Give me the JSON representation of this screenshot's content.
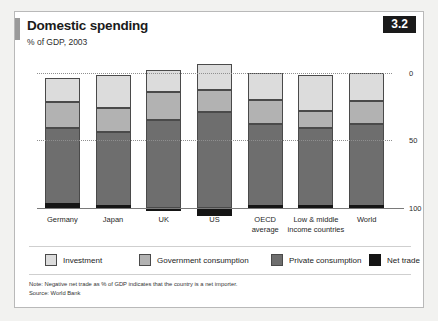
{
  "figure": {
    "badge": "3.2",
    "title": "Domestic spending",
    "subtitle": "% of GDP, 2003",
    "note": "Note: Negative net trade as % of GDP indicates that the country is a net importer.",
    "source": "Source: World Bank"
  },
  "legend": {
    "items": [
      {
        "label": "Investment",
        "key": "investment",
        "color": "#dcdcdc"
      },
      {
        "label": "Government consumption",
        "key": "government",
        "color": "#b2b2b2"
      },
      {
        "label": "Private consumption",
        "key": "private",
        "color": "#6e6e6e"
      },
      {
        "label": "Net trade",
        "key": "nettrade",
        "color": "#151515"
      }
    ]
  },
  "axis": {
    "yticks": [
      "100",
      "50",
      "0"
    ],
    "ytick_values": [
      100,
      50,
      0
    ]
  },
  "chart_data": {
    "type": "bar",
    "subtype": "stacked-column",
    "title": "Domestic spending",
    "subtitle": "% of GDP, 2003",
    "xlabel": "",
    "ylabel": "% of GDP",
    "ylim": [
      -5,
      110
    ],
    "yticks": [
      0,
      50,
      100
    ],
    "grid": "horizontal-dotted",
    "legend_position": "bottom",
    "categories": [
      "Germany",
      "Japan",
      "UK",
      "US",
      "OECD average",
      "Low & middle income countries",
      "World"
    ],
    "category_lines": [
      [
        "Germany"
      ],
      [
        "Japan"
      ],
      [
        "UK"
      ],
      [
        "US"
      ],
      [
        "OECD",
        "average"
      ],
      [
        "Low & middle",
        "income countries"
      ],
      [
        "World"
      ]
    ],
    "series": [
      {
        "name": "Private consumption",
        "key": "private",
        "color": "#6e6e6e",
        "values": [
          59,
          56,
          65,
          71,
          62,
          59,
          62
        ]
      },
      {
        "name": "Government consumption",
        "key": "government",
        "color": "#b2b2b2",
        "values": [
          19,
          18,
          21,
          16,
          18,
          13,
          17
        ]
      },
      {
        "name": "Investment",
        "key": "investment",
        "color": "#dcdcdc",
        "values": [
          18,
          24,
          16,
          19,
          20,
          26,
          21
        ]
      },
      {
        "name": "Net trade",
        "key": "nettrade",
        "color": "#151515",
        "values": [
          4,
          2,
          -2,
          -6,
          0,
          2,
          0
        ]
      }
    ],
    "note": "Note: Negative net trade as % of GDP indicates that the country is a net importer.",
    "source": "Source: World Bank"
  }
}
